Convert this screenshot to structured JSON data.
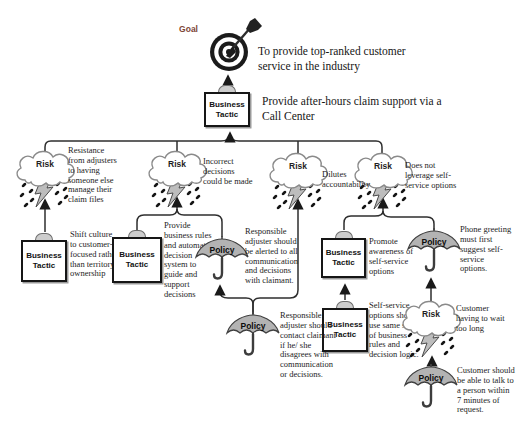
{
  "colors": {
    "goal_label": "#7d4536",
    "line": "#2e2e2e",
    "policy_fill": "#b3b3b3",
    "lightning_fill": "#bdbdbd"
  },
  "icons": {
    "goal": "target-icon",
    "risk": "storm-cloud-icon",
    "business_tactic": "clipboard-icon",
    "policy": "umbrella-icon"
  },
  "labels": {
    "goal": "Goal",
    "risk": "Risk",
    "policy": "Policy",
    "business_tactic": "Business Tactic"
  },
  "goal": {
    "description": "To provide top-ranked customer service in the industry"
  },
  "root_tactic": {
    "description": "Provide after-hours claim support via a Call Center"
  },
  "risks": [
    {
      "text": "Resistance from adjusters to having someone else manage their claim files"
    },
    {
      "text": "Incorrect decisions could be made"
    },
    {
      "text": "Dilutes accountability"
    },
    {
      "text": "Does not leverage self-service options"
    },
    {
      "text": "Customer having to wait too long"
    }
  ],
  "tactics": [
    {
      "text": "Shift culture to customer-focused rather than territory ownership"
    },
    {
      "text": "Provide business rules and automated decision system to guide and support decisions"
    },
    {
      "text": "Promote awareness of self-service options"
    },
    {
      "text": "Self-service options should use same set of business rules and decision logic."
    }
  ],
  "policies": [
    {
      "text": "Responsible adjuster should be alerted to all communication and decisions with claimant."
    },
    {
      "text": "Responsible adjuster should contact claimant if he/ she disagrees with communication or decisions."
    },
    {
      "text": "Phone greeting must first suggest self-service options."
    },
    {
      "text": "Customer should be able to talk to a person within 7 minutes of request."
    }
  ]
}
